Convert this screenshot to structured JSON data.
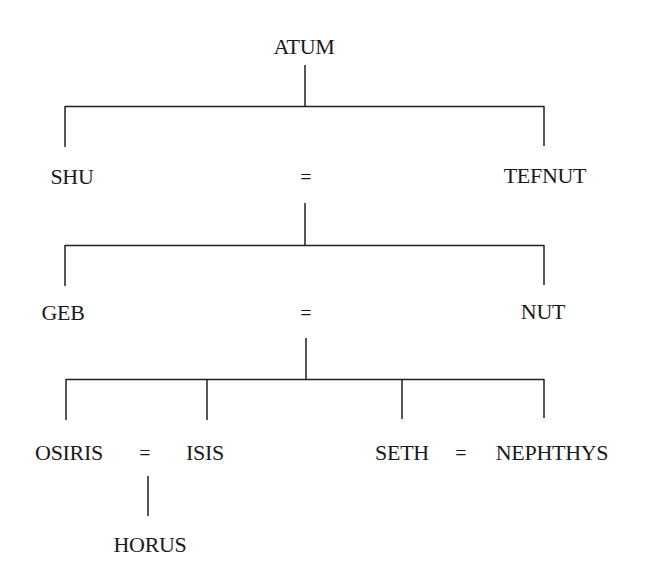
{
  "diagram": {
    "type": "family-tree",
    "generations": [
      {
        "level": 0,
        "members": [
          {
            "id": "atum",
            "name": "ATUM"
          }
        ]
      },
      {
        "level": 1,
        "members": [
          {
            "id": "shu",
            "name": "SHU"
          },
          {
            "id": "tefnut",
            "name": "TEFNUT"
          }
        ],
        "union": {
          "symbol": "=",
          "between": [
            "shu",
            "tefnut"
          ]
        },
        "parent": "atum"
      },
      {
        "level": 2,
        "members": [
          {
            "id": "geb",
            "name": "GEB"
          },
          {
            "id": "nut",
            "name": "NUT"
          }
        ],
        "union": {
          "symbol": "=",
          "between": [
            "geb",
            "nut"
          ]
        },
        "parent_union": [
          "shu",
          "tefnut"
        ]
      },
      {
        "level": 3,
        "members": [
          {
            "id": "osiris",
            "name": "OSIRIS"
          },
          {
            "id": "isis",
            "name": "ISIS"
          },
          {
            "id": "seth",
            "name": "SETH"
          },
          {
            "id": "nephthys",
            "name": "NEPHTHYS"
          }
        ],
        "unions": [
          {
            "symbol": "=",
            "between": [
              "osiris",
              "isis"
            ]
          },
          {
            "symbol": "=",
            "between": [
              "seth",
              "nephthys"
            ]
          }
        ],
        "parent_union": [
          "geb",
          "nut"
        ]
      },
      {
        "level": 4,
        "members": [
          {
            "id": "horus",
            "name": "HORUS"
          }
        ],
        "parent_union": [
          "osiris",
          "isis"
        ]
      }
    ],
    "labels": {
      "atum": "ATUM",
      "shu": "SHU",
      "tefnut": "TEFNUT",
      "geb": "GEB",
      "nut": "NUT",
      "osiris": "OSIRIS",
      "isis": "ISIS",
      "seth": "SETH",
      "nephthys": "NEPHTHYS",
      "horus": "HORUS"
    },
    "union_symbol": "=",
    "line_color": "#1f1f1f",
    "background": "#ffffff"
  }
}
